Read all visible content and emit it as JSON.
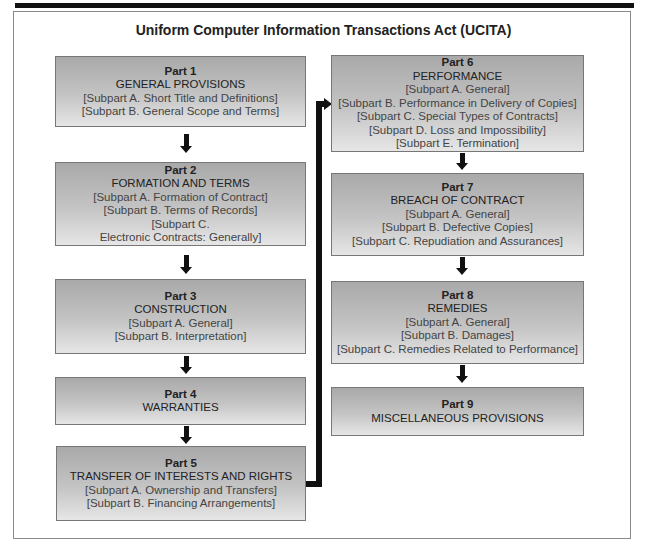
{
  "title": "Uniform Computer Information Transactions Act (UCITA)",
  "parts": [
    {
      "number": "Part 1",
      "title": "GENERAL PROVISIONS",
      "subparts": [
        "[Subpart A. Short Title and Definitions]",
        "[Subpart B. General Scope and Terms]"
      ]
    },
    {
      "number": "Part 2",
      "title": "FORMATION AND TERMS",
      "subparts": [
        "[Subpart A. Formation of Contract]",
        "[Subpart B. Terms of Records]",
        "[Subpart C.",
        "Electronic Contracts: Generally]"
      ]
    },
    {
      "number": "Part 3",
      "title": "CONSTRUCTION",
      "subparts": [
        "[Subpart A. General]",
        "[Subpart B. Interpretation]"
      ]
    },
    {
      "number": "Part 4",
      "title": "WARRANTIES",
      "subparts": []
    },
    {
      "number": "Part 5",
      "title": "TRANSFER OF INTERESTS AND RIGHTS",
      "subparts": [
        "[Subpart A. Ownership and Transfers]",
        "[Subpart B. Financing Arrangements]"
      ]
    },
    {
      "number": "Part 6",
      "title": "PERFORMANCE",
      "subparts": [
        "[Subpart A. General]",
        "[Subpart B. Performance in Delivery of Copies]",
        "[Subpart C. Special Types of Contracts]",
        "[Subpart D. Loss and Impossibility]",
        "[Subpart E. Termination]"
      ]
    },
    {
      "number": "Part 7",
      "title": "BREACH OF CONTRACT",
      "subparts": [
        "[Subpart A. General]",
        "[Subpart B. Defective Copies]",
        "[Subpart C. Repudiation and Assurances]"
      ]
    },
    {
      "number": "Part 8",
      "title": "REMEDIES",
      "subparts": [
        "[Subpart A. General]",
        "[Subpart B. Damages]",
        "[Subpart C. Remedies Related to Performance]"
      ]
    },
    {
      "number": "Part 9",
      "title": "MISCELLANEOUS PROVISIONS",
      "subparts": []
    }
  ],
  "colors": {
    "box_top": "#a9a9a9",
    "box_bottom": "#e6e6e6",
    "arrow": "#111111",
    "border": "#777777"
  }
}
